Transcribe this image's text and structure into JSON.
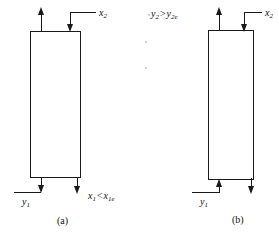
{
  "figure": {
    "type": "process-flow-diagram"
  },
  "panels": [
    {
      "id": "a",
      "caption": "(a)",
      "top_left_stream": {
        "name": "top-left-outlet-arrow",
        "direction": "up",
        "label": ""
      },
      "top_right_stream": {
        "name": "x2-inlet-arrow",
        "direction": "down",
        "label_var": "x",
        "label_sub": "2",
        "label_text": "x2"
      },
      "bottom_left_stream": {
        "name": "y1-inlet-arrow",
        "direction": "down",
        "label_var": "y",
        "label_sub": "1",
        "label_text": "y1"
      },
      "bottom_right_stream": {
        "name": "x1-outlet-arrow",
        "direction": "down",
        "label_lhs_var": "x",
        "label_lhs_sub": "1",
        "label_operator": "<",
        "label_rhs_var": "x",
        "label_rhs_sub": "1e",
        "label_text": "x1 < x1e"
      }
    },
    {
      "id": "b",
      "caption": "(b)",
      "top_left_stream": {
        "name": "y2-outlet-arrow",
        "direction": "up",
        "label_lhs_var": "y",
        "label_lhs_sub": "2",
        "label_operator": ">",
        "label_rhs_var": "y",
        "label_rhs_sub": "2e",
        "label_text": "y2 > y2e"
      },
      "top_right_stream": {
        "name": "x2-inlet-arrow",
        "direction": "down",
        "label_var": "x",
        "label_sub": "2",
        "label_text": "x2"
      },
      "bottom_left_stream": {
        "name": "y1-inlet-arrow",
        "direction": "up",
        "label_var": "y",
        "label_sub": "1",
        "label_text": "y1"
      },
      "bottom_right_stream": {
        "name": "x1-outlet-arrow",
        "direction": "down",
        "label": ""
      }
    }
  ],
  "colors": {
    "line": "#1a1a1a",
    "background": "#ffffff",
    "text": "#111111"
  }
}
